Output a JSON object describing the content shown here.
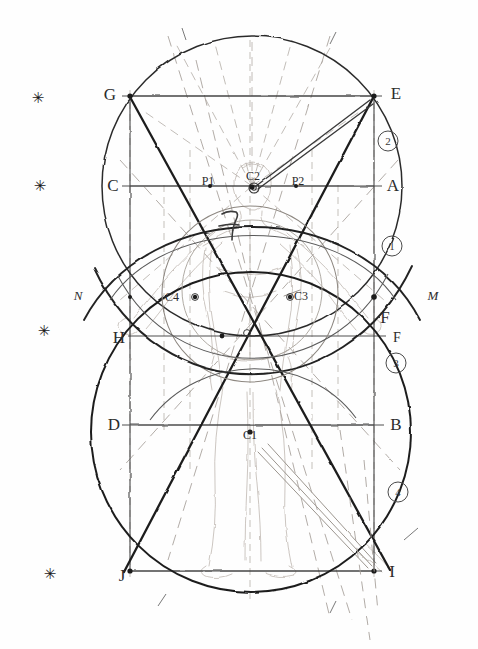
{
  "figure": {
    "medium": "pencil sketch on paper",
    "canvas": {
      "width": 478,
      "height": 649,
      "background": "#fefefe"
    },
    "ink": {
      "dark": "#1b1b1b",
      "mid": "#4d4d4d",
      "light": "#8c8c8c",
      "faint": "#b9b9b9",
      "ghost": "#cfc9c2"
    }
  },
  "vertex_labels": [
    {
      "name": "G",
      "text": "G",
      "x": 110,
      "y": 95,
      "style": "big"
    },
    {
      "name": "E",
      "text": "E",
      "x": 396,
      "y": 94,
      "style": "big"
    },
    {
      "name": "C",
      "text": "C",
      "x": 113,
      "y": 186,
      "style": "big"
    },
    {
      "name": "A",
      "text": "A",
      "x": 393,
      "y": 186,
      "style": "big"
    },
    {
      "name": "N",
      "text": "N",
      "x": 78,
      "y": 296,
      "style": "ital"
    },
    {
      "name": "M",
      "text": "M",
      "x": 433,
      "y": 296,
      "style": "ital"
    },
    {
      "name": "F-upper",
      "text": "F",
      "x": 385,
      "y": 318,
      "style": "big"
    },
    {
      "name": "H",
      "text": "H",
      "x": 119,
      "y": 338,
      "style": "big"
    },
    {
      "name": "F-lower",
      "text": "F",
      "x": 397,
      "y": 338,
      "style": "mid"
    },
    {
      "name": "D",
      "text": "D",
      "x": 114,
      "y": 425,
      "style": "big"
    },
    {
      "name": "B",
      "text": "B",
      "x": 396,
      "y": 425,
      "style": "big"
    },
    {
      "name": "J",
      "text": "J",
      "x": 122,
      "y": 576,
      "style": "big"
    },
    {
      "name": "I",
      "text": "I",
      "x": 392,
      "y": 572,
      "style": "big"
    }
  ],
  "center_labels": [
    {
      "name": "P1",
      "text": "P1",
      "x": 208,
      "y": 181,
      "style": "small"
    },
    {
      "name": "C2",
      "text": "C2",
      "x": 253,
      "y": 176,
      "style": "small"
    },
    {
      "name": "P2",
      "text": "P2",
      "x": 298,
      "y": 181,
      "style": "small"
    },
    {
      "name": "C4",
      "text": "C4",
      "x": 172,
      "y": 297,
      "style": "small"
    },
    {
      "name": "C3",
      "text": "C3",
      "x": 301,
      "y": 296,
      "style": "small"
    },
    {
      "name": "C1",
      "text": "C1",
      "x": 250,
      "y": 435,
      "style": "small"
    }
  ],
  "circled_numbers": [
    {
      "name": "marker-2",
      "text": "2",
      "x": 388,
      "y": 141
    },
    {
      "name": "marker-1",
      "text": "1",
      "x": 392,
      "y": 246
    },
    {
      "name": "marker-3",
      "text": "3",
      "x": 396,
      "y": 363
    },
    {
      "name": "marker-4",
      "text": "4",
      "x": 398,
      "y": 492
    }
  ],
  "asterisks": [
    {
      "name": "asterisk-1",
      "text": "✳",
      "x": 38,
      "y": 98
    },
    {
      "name": "asterisk-2",
      "text": "✳",
      "x": 40,
      "y": 186
    },
    {
      "name": "asterisk-3",
      "text": "✳",
      "x": 44,
      "y": 331
    },
    {
      "name": "asterisk-4",
      "text": "✳",
      "x": 50,
      "y": 574
    }
  ],
  "geometry": {
    "circle_upper": {
      "cx": 252,
      "cy": 186,
      "r": 150
    },
    "circle_lower": {
      "cx": 251,
      "cy": 432,
      "r": 160
    },
    "circle_mid": {
      "cx": 250,
      "cy": 295,
      "r": 88
    },
    "square_outer": {
      "x1": 130,
      "y1": 96,
      "x2": 374,
      "y2": 571
    },
    "horizontals": [
      96,
      186,
      296,
      336,
      425,
      571
    ],
    "verticals": [
      130,
      374,
      250
    ],
    "diagonals": [
      {
        "x1": 130,
        "y1": 96,
        "x2": 374,
        "y2": 571
      },
      {
        "x1": 374,
        "y1": 96,
        "x2": 130,
        "y2": 571
      }
    ]
  }
}
